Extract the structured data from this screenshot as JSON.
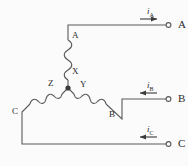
{
  "figure": {
    "background_color": "#fbfbfb",
    "line_color": "#5a5a5a",
    "text_color": "#2b2b2b"
  },
  "terminals": [
    {
      "name": "terminal-a",
      "label": "A",
      "x": 172,
      "y": 25,
      "marker": "open-circle"
    },
    {
      "name": "terminal-b",
      "label": "B",
      "x": 172,
      "y": 99,
      "marker": "open-circle"
    },
    {
      "name": "terminal-c",
      "label": "C",
      "x": 172,
      "y": 144,
      "marker": "open-circle"
    }
  ],
  "currents": [
    {
      "name": "current-ia",
      "symbol": "i",
      "subscript": "A",
      "direction": "right",
      "x": 150,
      "y": 12
    },
    {
      "name": "current-ib",
      "symbol": "i",
      "subscript": "B",
      "direction": "left",
      "x": 150,
      "y": 86
    },
    {
      "name": "current-ic",
      "symbol": "i",
      "subscript": "C",
      "direction": "left",
      "x": 150,
      "y": 130
    }
  ],
  "windings": [
    {
      "name": "winding-a-x",
      "start_label": "A",
      "end_label": "X",
      "orientation": "vertical"
    },
    {
      "name": "winding-b-y",
      "start_label": "Y",
      "end_label": "B",
      "orientation": "diagonal-down-right"
    },
    {
      "name": "winding-c-z",
      "start_label": "Z",
      "end_label": "C",
      "orientation": "diagonal-down-left"
    }
  ],
  "node_labels": [
    {
      "name": "winding-label-a",
      "text": "A",
      "x": 72,
      "y": 36
    },
    {
      "name": "winding-label-x",
      "text": "X",
      "x": 72,
      "y": 72
    },
    {
      "name": "winding-label-z",
      "text": "Z",
      "x": 51,
      "y": 84
    },
    {
      "name": "winding-label-y",
      "text": "Y",
      "x": 81,
      "y": 85
    },
    {
      "name": "winding-label-c",
      "text": "C",
      "x": 14,
      "y": 112
    },
    {
      "name": "winding-label-b",
      "text": "B",
      "x": 110,
      "y": 115
    }
  ],
  "star_point": {
    "name": "star-point-node",
    "x": 68,
    "y": 88
  }
}
